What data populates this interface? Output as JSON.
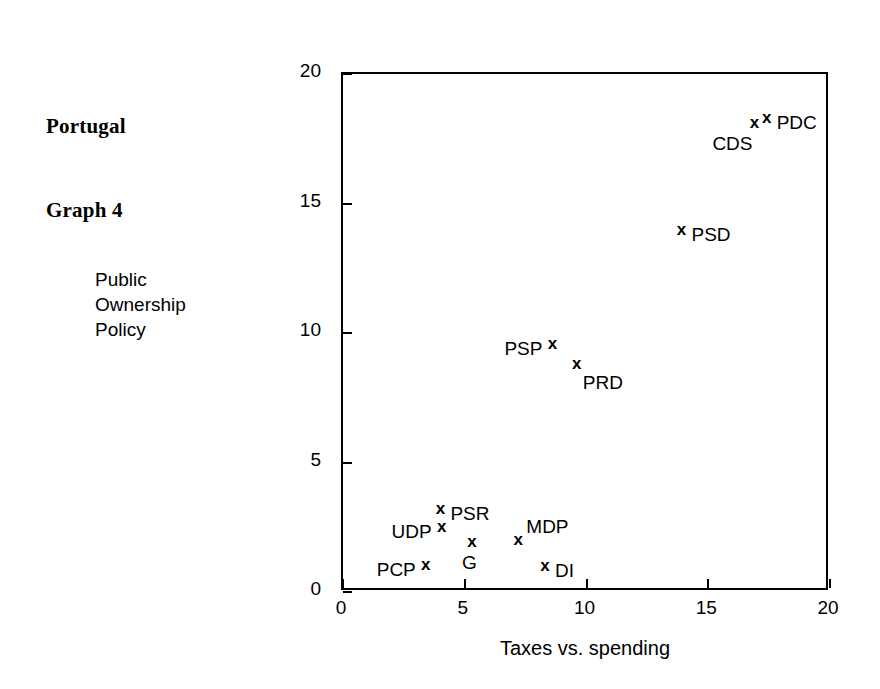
{
  "figure": {
    "title_lines": [
      "Portugal",
      "Graph 4"
    ],
    "background": "#ffffff",
    "ink_color": "#000000"
  },
  "chart_data": {
    "type": "scatter",
    "title": "Portugal Graph 4",
    "xlabel": "Taxes vs. spending",
    "ylabel_lines": [
      "Public",
      "Ownership",
      "Policy"
    ],
    "ylabel": "Public Ownership Policy",
    "xlim": [
      0,
      20
    ],
    "ylim": [
      0,
      20
    ],
    "xticks": [
      0,
      5,
      10,
      15,
      20
    ],
    "yticks": [
      0,
      5,
      10,
      15,
      20
    ],
    "xticklabels": [
      "0",
      "5",
      "10",
      "15",
      "20"
    ],
    "yticklabels": [
      "0",
      "5",
      "10",
      "15",
      "20"
    ],
    "grid": false,
    "legend": "none",
    "marker": "x",
    "points": [
      {
        "label": "PDC",
        "x": 17.4,
        "y": 18.1,
        "label_pos": "right"
      },
      {
        "label": "CDS",
        "x": 16.9,
        "y": 17.9,
        "label_pos": "below-left"
      },
      {
        "label": "PSD",
        "x": 13.9,
        "y": 13.8,
        "label_pos": "right"
      },
      {
        "label": "PSP",
        "x": 8.6,
        "y": 9.4,
        "label_pos": "left"
      },
      {
        "label": "PRD",
        "x": 9.6,
        "y": 8.6,
        "label_pos": "below-right"
      },
      {
        "label": "PSR",
        "x": 4.0,
        "y": 3.0,
        "label_pos": "right"
      },
      {
        "label": "UDP",
        "x": 4.05,
        "y": 2.3,
        "label_pos": "left"
      },
      {
        "label": "MDP",
        "x": 7.2,
        "y": 1.8,
        "label_pos": "above-right"
      },
      {
        "label": "G",
        "x": 5.3,
        "y": 1.75,
        "label_pos": "below"
      },
      {
        "label": "PCP",
        "x": 3.4,
        "y": 0.85,
        "label_pos": "left"
      },
      {
        "label": "DI",
        "x": 8.3,
        "y": 0.8,
        "label_pos": "right"
      }
    ]
  }
}
